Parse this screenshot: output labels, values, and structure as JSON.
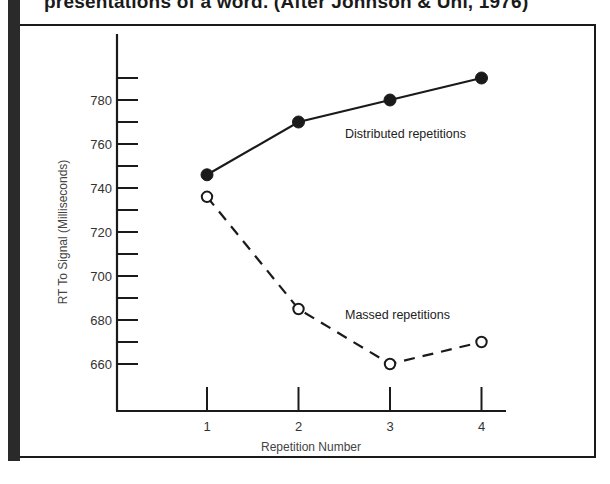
{
  "caption": "presentations of a word. (After Johnson & Uhl, 1976)",
  "chart_data": {
    "type": "line",
    "title": "",
    "xlabel": "Repetition Number",
    "ylabel": "RT To Signal  (Milliseconds)",
    "x": [
      1,
      2,
      3,
      4
    ],
    "x_tick_labels": [
      "1",
      "2",
      "3",
      "4"
    ],
    "y_tick_labels": [
      "780",
      "760",
      "740",
      "720",
      "700",
      "680",
      "660"
    ],
    "y_major_ticks": [
      780,
      760,
      740,
      720,
      700,
      680,
      660
    ],
    "y_minor_ticks": [
      790,
      770,
      750,
      730,
      710,
      690,
      670
    ],
    "ylim": [
      640,
      800
    ],
    "grid": false,
    "legend": "inline labels",
    "series": [
      {
        "name": "Distributed repetitions",
        "values": [
          746,
          770,
          780,
          790
        ],
        "line_style": "solid",
        "marker": "filled-circle"
      },
      {
        "name": "Massed repetitions",
        "values": [
          736,
          685,
          660,
          670
        ],
        "line_style": "dashed",
        "marker": "open-circle"
      }
    ]
  },
  "colors": {
    "line": "#1a1a1a",
    "frame": "#1a1a1a",
    "background": "#ffffff"
  }
}
